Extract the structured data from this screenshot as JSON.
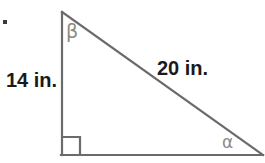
{
  "figure": {
    "type": "right-triangle-diagram",
    "background_color": "#ffffff",
    "line_color": "#6b6b6b",
    "label_color": "#1a1a1a",
    "angle_label_color": "#8a8a8a",
    "width": 265,
    "height": 163,
    "vertices": {
      "apex": {
        "x": 62,
        "y": 12
      },
      "right_angle_corner": {
        "x": 62,
        "y": 155
      },
      "base_right": {
        "x": 262,
        "y": 155
      }
    },
    "right_angle_marker": {
      "size": 18,
      "x": 62,
      "y": 137
    },
    "labels": {
      "vertical_leg": "14 in.",
      "hypotenuse": "20 in.",
      "angle_top": "β",
      "angle_bottom_right": "α"
    },
    "bullet_mark": "▪"
  }
}
